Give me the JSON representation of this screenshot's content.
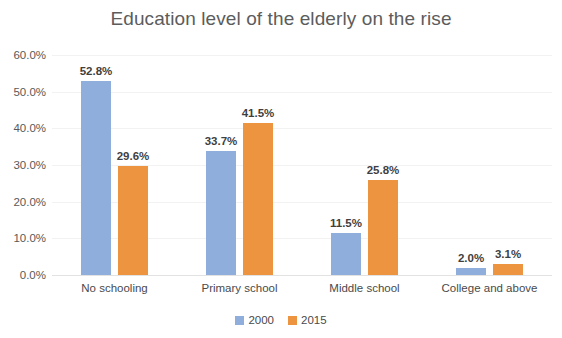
{
  "chart_data": {
    "type": "bar",
    "title": "Education level of the elderly on the rise",
    "xlabel": "",
    "ylabel": "",
    "categories": [
      "No schooling",
      "Primary school",
      "Middle school",
      "College and above"
    ],
    "series": [
      {
        "name": "2000",
        "color": "#8faedc",
        "values": [
          52.8,
          33.7,
          11.5,
          2.0
        ],
        "labels": [
          "52.8%",
          "29.6%",
          "11.5%",
          "2.0%"
        ]
      },
      {
        "name": "2015",
        "color": "#ed9440",
        "values": [
          29.6,
          41.5,
          25.8,
          3.1
        ],
        "labels": [
          "29.6%",
          "41.5%",
          "25.8%",
          "3.1%"
        ]
      }
    ],
    "series_2000_labels": [
      "52.8%",
      "33.7%",
      "11.5%",
      "2.0%"
    ],
    "series_2015_labels": [
      "29.6%",
      "41.5%",
      "25.8%",
      "3.1%"
    ],
    "ylim": [
      0,
      60
    ],
    "ytick_values": [
      60,
      50,
      40,
      30,
      20,
      10,
      0
    ],
    "ytick_labels": [
      "60.0%",
      "50.0%",
      "40.0%",
      "30.0%",
      "20.0%",
      "10.0%",
      "0.0%"
    ],
    "grid": true,
    "legend_position": "bottom",
    "legend": [
      "2000",
      "2015"
    ]
  }
}
